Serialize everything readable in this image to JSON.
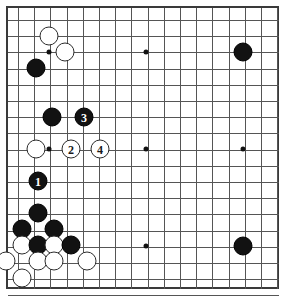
{
  "diagram": {
    "board_size": 19,
    "visible_columns": 17,
    "visible_rows": 18,
    "background_color": "#ffffff",
    "line_color": "#555555",
    "border_color": "#3a3a3a",
    "black_color": "#121212",
    "white_color": "#ffffff"
  },
  "geometry": {
    "origin_x": 16,
    "origin_y": 18,
    "step": 16.2,
    "cols": 17,
    "rows": 18,
    "frame_left": 6,
    "frame_top": 6,
    "frame_width": 273,
    "frame_height": 283
  },
  "hoshi": [
    {
      "name": "hoshi-upper-left",
      "cx": 47,
      "cy": 50
    },
    {
      "name": "hoshi-upper-mid",
      "cx": 144,
      "cy": 50
    },
    {
      "name": "hoshi-upper-right",
      "cx": 241,
      "cy": 50
    },
    {
      "name": "hoshi-center-left",
      "cx": 47,
      "cy": 147
    },
    {
      "name": "hoshi-center",
      "cx": 144,
      "cy": 147
    },
    {
      "name": "hoshi-center-right",
      "cx": 241,
      "cy": 147
    },
    {
      "name": "hoshi-lower-mid",
      "cx": 144,
      "cy": 244
    }
  ],
  "stones": [
    {
      "color": "white",
      "cx": 47,
      "cy": 34,
      "label": "",
      "name": "white-stone-c3a"
    },
    {
      "color": "white",
      "cx": 63,
      "cy": 50,
      "label": "",
      "name": "white-stone-d4"
    },
    {
      "color": "black",
      "cx": 34,
      "cy": 66,
      "label": "",
      "name": "black-stone-b5"
    },
    {
      "color": "black",
      "cx": 50,
      "cy": 115,
      "label": "",
      "name": "black-stone-c8"
    },
    {
      "color": "black",
      "cx": 82,
      "cy": 115,
      "label": "3",
      "name": "black-stone-move-3"
    },
    {
      "color": "white",
      "cx": 34,
      "cy": 147,
      "label": "",
      "name": "white-stone-b10"
    },
    {
      "color": "white",
      "cx": 69,
      "cy": 147,
      "label": "2",
      "name": "white-stone-move-2"
    },
    {
      "color": "white",
      "cx": 98,
      "cy": 147,
      "label": "4",
      "name": "white-stone-move-4"
    },
    {
      "color": "black",
      "cx": 36,
      "cy": 179,
      "label": "1",
      "name": "black-stone-move-1"
    },
    {
      "color": "black",
      "cx": 36,
      "cy": 211,
      "label": "",
      "name": "black-stone-b14"
    },
    {
      "color": "black",
      "cx": 20,
      "cy": 227,
      "label": "",
      "name": "black-stone-a15"
    },
    {
      "color": "black",
      "cx": 52,
      "cy": 227,
      "label": "",
      "name": "black-stone-c15"
    },
    {
      "color": "white",
      "cx": 20,
      "cy": 243,
      "label": "",
      "name": "white-stone-a16"
    },
    {
      "color": "black",
      "cx": 36,
      "cy": 243,
      "label": "",
      "name": "black-stone-b16"
    },
    {
      "color": "white",
      "cx": 52,
      "cy": 243,
      "label": "",
      "name": "white-stone-c16"
    },
    {
      "color": "black",
      "cx": 69,
      "cy": 243,
      "label": "",
      "name": "black-stone-d16"
    },
    {
      "color": "white",
      "cx": 4,
      "cy": 259,
      "label": "",
      "name": "white-stone-edge-a17"
    },
    {
      "color": "white",
      "cx": 36,
      "cy": 259,
      "label": "",
      "name": "white-stone-b17"
    },
    {
      "color": "white",
      "cx": 52,
      "cy": 259,
      "label": "",
      "name": "white-stone-c17"
    },
    {
      "color": "white",
      "cx": 85,
      "cy": 259,
      "label": "",
      "name": "white-stone-e17"
    },
    {
      "color": "white",
      "cx": 20,
      "cy": 276,
      "label": "",
      "name": "white-stone-a18"
    },
    {
      "color": "black",
      "cx": 241,
      "cy": 50,
      "label": "",
      "name": "black-stone-upper-right-hoshi"
    },
    {
      "color": "black",
      "cx": 241,
      "cy": 244,
      "label": "",
      "name": "black-stone-lower-right-hoshi"
    }
  ]
}
